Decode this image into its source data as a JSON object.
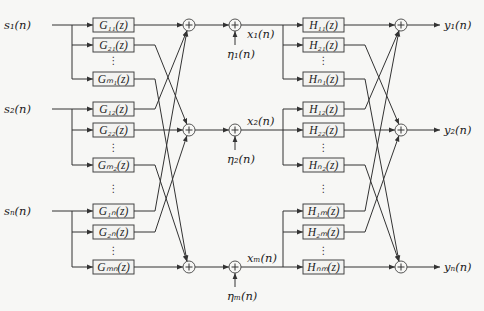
{
  "diagram": {
    "inputs": [
      {
        "id": "s1",
        "label": "s₁(n)",
        "y": 25
      },
      {
        "id": "s2",
        "label": "s₂(n)",
        "y": 109
      },
      {
        "id": "sN",
        "label": "sₙ(n)",
        "y": 211
      }
    ],
    "g_blocks": [
      {
        "label": "G₁₁(z)",
        "y": 25,
        "input": 0,
        "sum": 0
      },
      {
        "label": "G₂₁(z)",
        "y": 45,
        "input": 0,
        "sum": 1
      },
      {
        "label": "Gₘ₁(z)",
        "y": 79,
        "input": 0,
        "sum": 2
      },
      {
        "label": "G₁₂(z)",
        "y": 109,
        "input": 1,
        "sum": 0
      },
      {
        "label": "G₂₂(z)",
        "y": 130,
        "input": 1,
        "sum": 1
      },
      {
        "label": "Gₘ₂(z)",
        "y": 165,
        "input": 1,
        "sum": 2
      },
      {
        "label": "G₁ₙ(z)",
        "y": 211,
        "input": 2,
        "sum": 0
      },
      {
        "label": "G₂ₙ(z)",
        "y": 232,
        "input": 2,
        "sum": 1
      },
      {
        "label": "Gₘₙ(z)",
        "y": 267,
        "input": 2,
        "sum": 2
      }
    ],
    "mid_rows": [
      {
        "y": 25,
        "x_label": "x₁(n)",
        "noise_label": "η₁(n)"
      },
      {
        "y": 130,
        "x_label": "x₂(n)",
        "noise_label": "η₂(n)"
      },
      {
        "y": 267,
        "x_label": "xₘ(n)",
        "noise_label": "ηₘ(n)"
      }
    ],
    "h_blocks": [
      {
        "label": "H₁₁(z)",
        "y": 25,
        "input": 0,
        "sum": 0
      },
      {
        "label": "H₂₁(z)",
        "y": 45,
        "input": 0,
        "sum": 1
      },
      {
        "label": "Hₙ₁(z)",
        "y": 79,
        "input": 0,
        "sum": 2
      },
      {
        "label": "H₁₂(z)",
        "y": 109,
        "input": 1,
        "sum": 0
      },
      {
        "label": "H₂₂(z)",
        "y": 130,
        "input": 1,
        "sum": 1
      },
      {
        "label": "Hₙ₂(z)",
        "y": 165,
        "input": 1,
        "sum": 2
      },
      {
        "label": "H₁ₘ(z)",
        "y": 211,
        "input": 2,
        "sum": 0
      },
      {
        "label": "H₂ₘ(z)",
        "y": 232,
        "input": 2,
        "sum": 1
      },
      {
        "label": "Hₙₘ(z)",
        "y": 267,
        "input": 2,
        "sum": 2
      }
    ],
    "outputs": [
      {
        "id": "y1",
        "label": "y₁(n)",
        "y": 25
      },
      {
        "id": "y2",
        "label": "y₂(n)",
        "y": 130
      },
      {
        "id": "yN",
        "label": "yₙ(n)",
        "y": 267
      }
    ],
    "ellipsis": "⋮",
    "sum_symbol": "+"
  }
}
